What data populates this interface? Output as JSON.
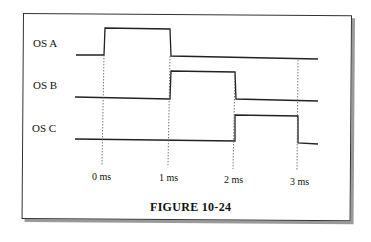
{
  "figure": {
    "caption": "FIGURE 10-24",
    "signals": [
      {
        "name": "OS A",
        "high_from_ms": 0,
        "high_to_ms": 1
      },
      {
        "name": "OS B",
        "high_from_ms": 1,
        "high_to_ms": 2
      },
      {
        "name": "OS C",
        "high_from_ms": 2,
        "high_to_ms": 3
      }
    ],
    "time_ticks": [
      "0 ms",
      "1 ms",
      "2 ms",
      "3 ms"
    ]
  }
}
